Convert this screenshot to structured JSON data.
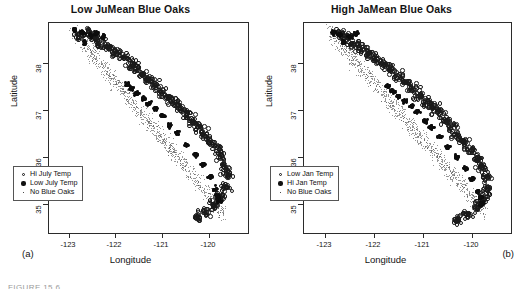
{
  "figure": {
    "caption_fragment": "FIGURE 15.6",
    "panel_labels": [
      "(a)",
      "(b)"
    ]
  },
  "panels": [
    {
      "id": "low-jumean-blue-oaks",
      "title": "Low JuMean Blue Oaks",
      "corner_label": "(a)",
      "xlabel": "Longitude",
      "ylabel": "Latitude",
      "xticks": [
        "-123",
        "-122",
        "-121",
        "-120"
      ],
      "yticks": [
        "38",
        "37",
        "36",
        "35"
      ],
      "legend": [
        {
          "key": "open-circle",
          "label": "Hi July Temp"
        },
        {
          "key": "solid-circle",
          "label": "Low July Temp"
        },
        {
          "key": "small-dot",
          "label": "No Blue Oaks"
        }
      ]
    },
    {
      "id": "high-jamean-blue-oaks",
      "title": "High JaMean Blue Oaks",
      "corner_label": "(b)",
      "xlabel": "Longitude",
      "ylabel": "Latitude",
      "xticks": [
        "-123",
        "-122",
        "-121",
        "-120"
      ],
      "yticks": [
        "38",
        "37",
        "36",
        "35"
      ],
      "legend": [
        {
          "key": "open-circle",
          "label": "Low Jan Temp"
        },
        {
          "key": "solid-circle",
          "label": "Hi Jan Temp"
        },
        {
          "key": "small-dot",
          "label": "No Blue Oaks"
        }
      ]
    }
  ],
  "chart_data": [
    {
      "type": "scatter",
      "title": "Low JuMean Blue Oaks",
      "xlabel": "Longitude",
      "ylabel": "Latitude",
      "xlim": [
        -123.6,
        -119.4
      ],
      "ylim": [
        34.4,
        38.7
      ],
      "xticks": [
        -123,
        -122,
        -121,
        -120
      ],
      "yticks": [
        38,
        37,
        36,
        35
      ],
      "grid": false,
      "legend_position": "lower-left",
      "series": [
        {
          "name": "Hi July Temp",
          "marker": "open-circle",
          "n": 520,
          "description": "Open circles tracing the Coast Range / inner foothill band from the northwest (-123.0, 38.5) down to the southeast (-119.8, 34.7)",
          "points": [
            [
              -122.95,
              38.45
            ],
            [
              -122.78,
              38.52
            ],
            [
              -122.62,
              38.38
            ],
            [
              -122.5,
              38.3
            ],
            [
              -122.35,
              38.2
            ],
            [
              -122.2,
              38.12
            ],
            [
              -122.05,
              38.02
            ],
            [
              -121.9,
              37.9
            ],
            [
              -121.78,
              37.8
            ],
            [
              -121.65,
              37.68
            ],
            [
              -121.5,
              37.55
            ],
            [
              -121.38,
              37.45
            ],
            [
              -121.25,
              37.32
            ],
            [
              -121.1,
              37.2
            ],
            [
              -120.98,
              37.1
            ],
            [
              -120.85,
              36.98
            ],
            [
              -120.72,
              36.85
            ],
            [
              -120.6,
              36.72
            ],
            [
              -120.48,
              36.6
            ],
            [
              -120.35,
              36.45
            ],
            [
              -120.22,
              36.3
            ],
            [
              -120.1,
              36.15
            ],
            [
              -120.0,
              36.0
            ],
            [
              -119.92,
              35.8
            ],
            [
              -119.85,
              35.6
            ],
            [
              -119.9,
              35.35
            ],
            [
              -120.0,
              35.15
            ],
            [
              -120.15,
              35.0
            ],
            [
              -120.3,
              34.85
            ],
            [
              -120.5,
              34.75
            ]
          ]
        },
        {
          "name": "Low July Temp",
          "marker": "solid-circle",
          "n": 330,
          "description": "Solid black clusters concentrated in the northwest coastal block near (-122.8, 38.4) and in dense foothill knots around (-121.6, 37.2), (-121.0, 36.5) and (-120.1, 35.2)",
          "points": [
            [
              -123.05,
              38.55
            ],
            [
              -122.9,
              38.5
            ],
            [
              -122.85,
              38.3
            ],
            [
              -122.7,
              38.45
            ],
            [
              -122.6,
              38.5
            ],
            [
              -122.45,
              38.42
            ],
            [
              -121.95,
              37.45
            ],
            [
              -121.85,
              37.35
            ],
            [
              -121.75,
              37.25
            ],
            [
              -121.6,
              37.15
            ],
            [
              -121.5,
              37.05
            ],
            [
              -121.35,
              36.95
            ],
            [
              -121.2,
              36.8
            ],
            [
              -121.05,
              36.6
            ],
            [
              -120.9,
              36.45
            ],
            [
              -120.7,
              36.2
            ],
            [
              -120.5,
              36.0
            ],
            [
              -120.35,
              35.8
            ],
            [
              -120.2,
              35.55
            ],
            [
              -120.1,
              35.3
            ],
            [
              -120.05,
              35.15
            ],
            [
              -120.0,
              35.05
            ]
          ]
        },
        {
          "name": "No Blue Oaks",
          "marker": "small-dot",
          "n": 900,
          "description": "Fine background dots filling the same diagonal swath at low visual weight"
        }
      ]
    },
    {
      "type": "scatter",
      "title": "High JaMean Blue Oaks",
      "xlabel": "Longitude",
      "ylabel": "Latitude",
      "xlim": [
        -123.6,
        -119.4
      ],
      "ylim": [
        34.4,
        38.7
      ],
      "xticks": [
        -123,
        -122,
        -121,
        -120
      ],
      "yticks": [
        38,
        37,
        36,
        35
      ],
      "grid": false,
      "legend_position": "lower-left",
      "series": [
        {
          "name": "Low Jan Temp",
          "marker": "open-circle",
          "n": 540,
          "description": "Open circles spread along the same northwest-to-southeast diagonal band, heavier on the eastern (inland) edge",
          "points": [
            [
              -122.9,
              38.5
            ],
            [
              -122.75,
              38.42
            ],
            [
              -122.6,
              38.3
            ],
            [
              -122.45,
              38.2
            ],
            [
              -122.3,
              38.1
            ],
            [
              -122.15,
              38.0
            ],
            [
              -122.0,
              37.88
            ],
            [
              -121.85,
              37.76
            ],
            [
              -121.7,
              37.62
            ],
            [
              -121.55,
              37.5
            ],
            [
              -121.4,
              37.38
            ],
            [
              -121.28,
              37.25
            ],
            [
              -121.15,
              37.12
            ],
            [
              -121.0,
              37.0
            ],
            [
              -120.88,
              36.88
            ],
            [
              -120.75,
              36.72
            ],
            [
              -120.62,
              36.58
            ],
            [
              -120.5,
              36.42
            ],
            [
              -120.38,
              36.28
            ],
            [
              -120.25,
              36.12
            ],
            [
              -120.12,
              35.95
            ],
            [
              -120.02,
              35.75
            ],
            [
              -119.95,
              35.55
            ],
            [
              -119.92,
              35.3
            ],
            [
              -120.0,
              35.1
            ],
            [
              -120.12,
              34.95
            ],
            [
              -120.3,
              34.8
            ],
            [
              -120.5,
              34.7
            ]
          ]
        },
        {
          "name": "Hi Jan Temp",
          "marker": "solid-circle",
          "n": 300,
          "description": "Solid black clusters in the northwest block near (-122.8, 38.4) and dense knots at (-121.5, 37.1), (-120.9, 36.4) and a large clump near (-120.05, 35.15)",
          "points": [
            [
              -123.0,
              38.5
            ],
            [
              -122.88,
              38.45
            ],
            [
              -122.8,
              38.3
            ],
            [
              -122.65,
              38.42
            ],
            [
              -122.55,
              38.48
            ],
            [
              -121.9,
              37.4
            ],
            [
              -121.8,
              37.3
            ],
            [
              -121.68,
              37.2
            ],
            [
              -121.55,
              37.1
            ],
            [
              -121.42,
              37.0
            ],
            [
              -121.3,
              36.88
            ],
            [
              -121.15,
              36.7
            ],
            [
              -121.0,
              36.55
            ],
            [
              -120.85,
              36.38
            ],
            [
              -120.68,
              36.15
            ],
            [
              -120.5,
              35.95
            ],
            [
              -120.32,
              35.72
            ],
            [
              -120.18,
              35.5
            ],
            [
              -120.08,
              35.25
            ],
            [
              -120.02,
              35.12
            ],
            [
              -119.98,
              35.0
            ]
          ]
        },
        {
          "name": "No Blue Oaks",
          "marker": "small-dot",
          "n": 900,
          "description": "Fine background dots filling the same diagonal swath at low visual weight"
        }
      ]
    }
  ]
}
